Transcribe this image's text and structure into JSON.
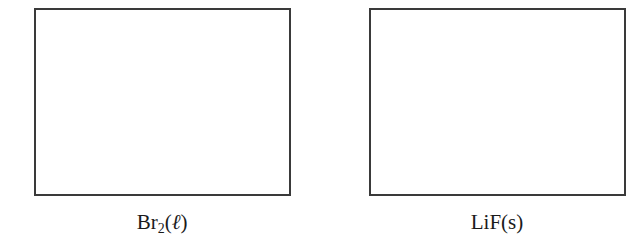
{
  "diagram": {
    "panels": [
      {
        "id": "left",
        "content": "empty",
        "label": {
          "base": "Br",
          "subscript": "2",
          "phase_open": "(",
          "phase": "ℓ",
          "phase_close": ")"
        }
      },
      {
        "id": "right",
        "content": "empty",
        "label": {
          "text": "LiF(s)"
        }
      }
    ],
    "colors": {
      "border": "#3a3a3a",
      "text": "#1a1a1a",
      "background": "#ffffff"
    }
  }
}
